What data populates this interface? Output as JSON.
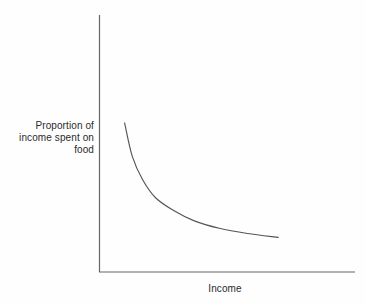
{
  "chart_data": {
    "type": "line",
    "title": "",
    "subtitle": "",
    "xlabel": "Income",
    "ylabel": "Proportion of\nincome spent on\nfood",
    "ylabel_lines": [
      "Proportion of",
      "income spent on",
      "food"
    ],
    "legend": [],
    "annotations": [],
    "grid": false,
    "axis_ticks": false,
    "tick_labels_x": [],
    "tick_labels_y": [],
    "series": [
      {
        "name": "Engel curve",
        "shape": "decreasing-convex-hyperbolic",
        "points": [
          {
            "x": 0.1,
            "y": 0.58
          },
          {
            "x": 0.13,
            "y": 0.45
          },
          {
            "x": 0.17,
            "y": 0.36
          },
          {
            "x": 0.22,
            "y": 0.29
          },
          {
            "x": 0.29,
            "y": 0.24
          },
          {
            "x": 0.37,
            "y": 0.2
          },
          {
            "x": 0.47,
            "y": 0.17
          },
          {
            "x": 0.58,
            "y": 0.15
          },
          {
            "x": 0.7,
            "y": 0.135
          }
        ]
      }
    ],
    "xlim": [
      0,
      1
    ],
    "ylim": [
      0,
      1
    ],
    "colors": {
      "line": "#555555",
      "axis": "#666666",
      "background": "#fefefe",
      "text": "#2b2b2b"
    }
  },
  "axes": {
    "y_axis_name": "y-axis-line",
    "x_axis_name": "x-axis-line"
  }
}
